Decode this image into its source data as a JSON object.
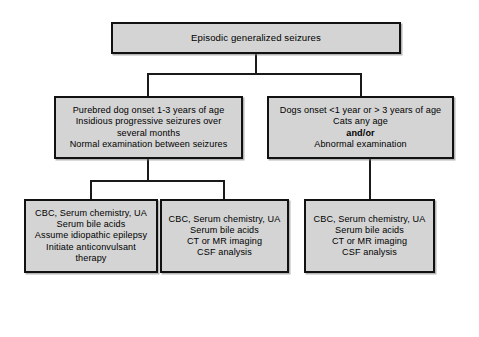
{
  "figure": {
    "type": "flowchart",
    "orientation": "top-down",
    "background_color": "#ffffff",
    "node_fill_color": "#d4d4d4",
    "node_border_color": "#111111",
    "connector_color": "#1a1a1a"
  },
  "nodes": {
    "root": {
      "id": "episodic-generalized-seizures",
      "level": 1,
      "text": "Episodic generalized seizures"
    },
    "branch_left": {
      "id": "purebred-dog-profile",
      "level": 2,
      "text": "Purebred dog onset 1-3 years of age\nInsidious progressive seizures over\nseveral months\nNormal examination between seizures"
    },
    "branch_right": {
      "id": "atypical-age-or-abnormal-exam",
      "level": 2,
      "line_1": "Dogs onset <1 year or > 3 years of age",
      "line_2": "Cats any age",
      "line_3_bold": "and/or",
      "line_4": "Abnormal examination"
    },
    "leaf_1": {
      "id": "idiopathic-epilepsy-workup",
      "level": 3,
      "text": "CBC, Serum chemistry, UA\nSerum bile acids\nAssume idiopathic epilepsy\nInitiate anticonvulsant\ntherapy"
    },
    "leaf_2": {
      "id": "advanced-imaging-workup-left",
      "level": 3,
      "text": "CBC, Serum chemistry, UA\nSerum bile acids\nCT or MR imaging\nCSF analysis"
    },
    "leaf_3": {
      "id": "advanced-imaging-workup-right",
      "level": 3,
      "text": "CBC, Serum chemistry, UA\nSerum bile acids\nCT or MR imaging\nCSF analysis"
    }
  },
  "edges": [
    {
      "from": "root",
      "to": "branch_left",
      "style": "orthogonal"
    },
    {
      "from": "root",
      "to": "branch_right",
      "style": "orthogonal"
    },
    {
      "from": "branch_left",
      "to": "leaf_1",
      "style": "orthogonal"
    },
    {
      "from": "branch_left",
      "to": "leaf_2",
      "style": "orthogonal"
    },
    {
      "from": "branch_right",
      "to": "leaf_3",
      "style": "straight"
    }
  ]
}
